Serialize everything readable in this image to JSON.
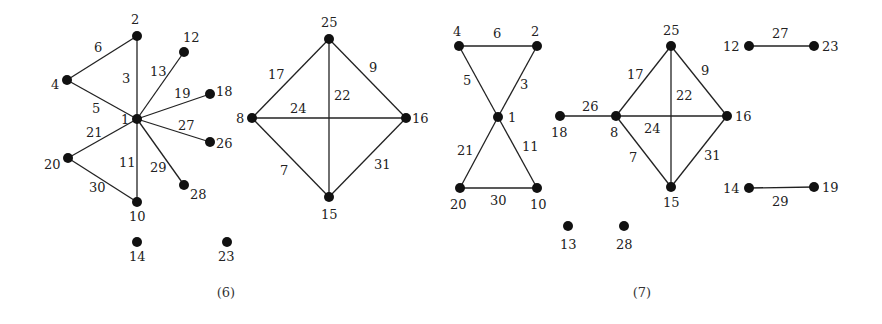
{
  "figures": [
    {
      "id": "fig6",
      "caption": "(6)",
      "caption_pos": [
        226,
        297
      ],
      "nodes": [
        {
          "id": "1",
          "x": 137,
          "y": 119,
          "lx": 121,
          "ly": 124
        },
        {
          "id": "2",
          "x": 137,
          "y": 36,
          "lx": 131,
          "ly": 24
        },
        {
          "id": "4",
          "x": 67,
          "y": 80,
          "lx": 51,
          "ly": 89
        },
        {
          "id": "12",
          "x": 184,
          "y": 52,
          "lx": 183,
          "ly": 42
        },
        {
          "id": "18",
          "x": 210,
          "y": 94,
          "lx": 216,
          "ly": 96
        },
        {
          "id": "26",
          "x": 210,
          "y": 142,
          "lx": 216,
          "ly": 148
        },
        {
          "id": "28",
          "x": 184,
          "y": 185,
          "lx": 190,
          "ly": 199
        },
        {
          "id": "20",
          "x": 68,
          "y": 158,
          "lx": 44,
          "ly": 169
        },
        {
          "id": "10",
          "x": 137,
          "y": 202,
          "lx": 129,
          "ly": 221
        },
        {
          "id": "14",
          "x": 137,
          "y": 242,
          "lx": 129,
          "ly": 261
        },
        {
          "id": "23",
          "x": 227,
          "y": 242,
          "lx": 218,
          "ly": 261
        },
        {
          "id": "25",
          "x": 329,
          "y": 39,
          "lx": 321,
          "ly": 27
        },
        {
          "id": "8",
          "x": 252,
          "y": 118,
          "lx": 236,
          "ly": 123
        },
        {
          "id": "16",
          "x": 406,
          "y": 118,
          "lx": 412,
          "ly": 123
        },
        {
          "id": "15",
          "x": 329,
          "y": 197,
          "lx": 321,
          "ly": 219
        }
      ],
      "edges": [
        {
          "from": "2",
          "to": "4",
          "label": "6",
          "lx": 94,
          "ly": 52
        },
        {
          "from": "2",
          "to": "1",
          "label": "3",
          "lx": 122,
          "ly": 83
        },
        {
          "from": "4",
          "to": "1",
          "label": "5",
          "lx": 92,
          "ly": 113
        },
        {
          "from": "12",
          "to": "1",
          "label": "13",
          "lx": 150,
          "ly": 76
        },
        {
          "from": "18",
          "to": "1",
          "label": "19",
          "lx": 174,
          "ly": 98
        },
        {
          "from": "26",
          "to": "1",
          "label": "27",
          "lx": 178,
          "ly": 130
        },
        {
          "from": "28",
          "to": "1",
          "label": "29",
          "lx": 150,
          "ly": 172
        },
        {
          "from": "20",
          "to": "1",
          "label": "21",
          "lx": 86,
          "ly": 137
        },
        {
          "from": "10",
          "to": "1",
          "label": "11",
          "lx": 119,
          "ly": 167
        },
        {
          "from": "20",
          "to": "10",
          "label": "30",
          "lx": 89,
          "ly": 192
        },
        {
          "from": "25",
          "to": "8",
          "label": "17",
          "lx": 268,
          "ly": 79
        },
        {
          "from": "25",
          "to": "16",
          "label": "9",
          "lx": 369,
          "ly": 72
        },
        {
          "from": "25",
          "to": "15",
          "label": "22",
          "lx": 334,
          "ly": 100
        },
        {
          "from": "8",
          "to": "16",
          "label": "24",
          "lx": 290,
          "ly": 113
        },
        {
          "from": "8",
          "to": "15",
          "label": "7",
          "lx": 280,
          "ly": 175
        },
        {
          "from": "16",
          "to": "15",
          "label": "31",
          "lx": 374,
          "ly": 169
        }
      ]
    },
    {
      "id": "fig7",
      "caption": "(7)",
      "caption_pos": [
        642,
        297
      ],
      "nodes": [
        {
          "id": "4",
          "x": 459,
          "y": 46,
          "lx": 453,
          "ly": 36
        },
        {
          "id": "2",
          "x": 537,
          "y": 46,
          "lx": 531,
          "ly": 36
        },
        {
          "id": "1",
          "x": 498,
          "y": 117,
          "lx": 508,
          "ly": 122
        },
        {
          "id": "20",
          "x": 460,
          "y": 188,
          "lx": 450,
          "ly": 209
        },
        {
          "id": "10",
          "x": 537,
          "y": 188,
          "lx": 530,
          "ly": 209
        },
        {
          "id": "18",
          "x": 560,
          "y": 116,
          "lx": 551,
          "ly": 137
        },
        {
          "id": "8",
          "x": 616,
          "y": 116,
          "lx": 610,
          "ly": 137
        },
        {
          "id": "25",
          "x": 671,
          "y": 46,
          "lx": 663,
          "ly": 35
        },
        {
          "id": "16",
          "x": 727,
          "y": 116,
          "lx": 735,
          "ly": 121
        },
        {
          "id": "15",
          "x": 671,
          "y": 187,
          "lx": 663,
          "ly": 207
        },
        {
          "id": "12",
          "x": 749,
          "y": 46,
          "lx": 723,
          "ly": 51
        },
        {
          "id": "23",
          "x": 814,
          "y": 46,
          "lx": 822,
          "ly": 51
        },
        {
          "id": "14",
          "x": 749,
          "y": 188,
          "lx": 723,
          "ly": 193
        },
        {
          "id": "19",
          "x": 814,
          "y": 187,
          "lx": 822,
          "ly": 192
        },
        {
          "id": "13",
          "x": 568,
          "y": 226,
          "lx": 560,
          "ly": 249
        },
        {
          "id": "28",
          "x": 624,
          "y": 226,
          "lx": 616,
          "ly": 249
        }
      ],
      "edges": [
        {
          "from": "4",
          "to": "2",
          "label": "6",
          "lx": 493,
          "ly": 38
        },
        {
          "from": "4",
          "to": "1",
          "label": "5",
          "lx": 463,
          "ly": 85
        },
        {
          "from": "2",
          "to": "1",
          "label": "3",
          "lx": 520,
          "ly": 89
        },
        {
          "from": "20",
          "to": "1",
          "label": "21",
          "lx": 457,
          "ly": 155
        },
        {
          "from": "10",
          "to": "1",
          "label": "11",
          "lx": 522,
          "ly": 151
        },
        {
          "from": "20",
          "to": "10",
          "label": "30",
          "lx": 490,
          "ly": 205
        },
        {
          "from": "18",
          "to": "8",
          "label": "26",
          "lx": 582,
          "ly": 111
        },
        {
          "from": "25",
          "to": "8",
          "label": "17",
          "lx": 627,
          "ly": 79
        },
        {
          "from": "25",
          "to": "16",
          "label": "9",
          "lx": 701,
          "ly": 75
        },
        {
          "from": "25",
          "to": "15",
          "label": "22",
          "lx": 676,
          "ly": 100
        },
        {
          "from": "8",
          "to": "16",
          "label": "24",
          "lx": 644,
          "ly": 133
        },
        {
          "from": "8",
          "to": "15",
          "label": "7",
          "lx": 629,
          "ly": 162
        },
        {
          "from": "16",
          "to": "15",
          "label": "31",
          "lx": 704,
          "ly": 160
        },
        {
          "from": "12",
          "to": "23",
          "label": "27",
          "lx": 772,
          "ly": 38
        },
        {
          "from": "14",
          "to": "19",
          "label": "29",
          "lx": 772,
          "ly": 206
        }
      ]
    }
  ]
}
